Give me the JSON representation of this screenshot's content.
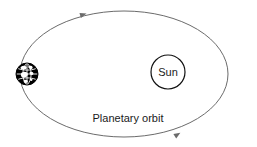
{
  "diagram": {
    "background_color": "#ffffff",
    "orbit": {
      "label": "Planetary orbit",
      "label_x": 128,
      "label_y": 122,
      "center_x": 124,
      "center_y": 74,
      "radius_x": 104,
      "radius_y": 63,
      "stroke_color": "#6b6b6b",
      "stroke_width": 1,
      "direction_markers": 2
    },
    "sun": {
      "label": "Sun",
      "center_x": 168,
      "center_y": 72,
      "radius": 17,
      "fill_color": "#ffffff",
      "stroke_color": "#111111",
      "stroke_width": 1.2,
      "label_x": 168,
      "label_y": 76
    },
    "earth": {
      "label": "Earth",
      "center_x": 27,
      "center_y": 74,
      "radius": 11,
      "fill_color": "#000000",
      "land_color": "#ffffff",
      "stroke_color": "#000000"
    },
    "arrows": [
      {
        "name": "orbit-direction-arrow-top",
        "x": 85,
        "y": 14,
        "rotation": -18
      },
      {
        "name": "orbit-direction-arrow-bottom",
        "x": 178,
        "y": 133,
        "rotation": -33
      }
    ]
  }
}
